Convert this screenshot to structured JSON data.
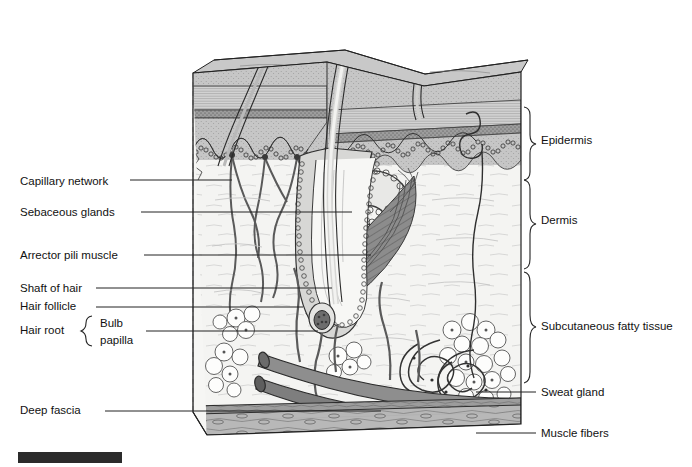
{
  "figure": {
    "title": "",
    "background_color": "#ffffff",
    "ink_color": "#111111"
  },
  "labels_left": [
    {
      "id": "capillary-network",
      "text": "Capillary network",
      "x": 20,
      "y": 185,
      "leader_y": 180,
      "leader_x_end": 232
    },
    {
      "id": "sebaceous-glands",
      "text": "Sebaceous glands",
      "x": 20,
      "y": 216,
      "leader_y": 212,
      "leader_x_end": 352
    },
    {
      "id": "arrector-pili",
      "text": "Arrector pili muscle",
      "x": 20,
      "y": 259,
      "leader_y": 255,
      "leader_x_end": 371
    },
    {
      "id": "shaft-of-hair",
      "text": "Shaft of hair",
      "x": 20,
      "y": 292,
      "leader_y": 288,
      "leader_x_end": 330
    },
    {
      "id": "hair-follicle",
      "text": "Hair follicle",
      "x": 20,
      "y": 310,
      "leader_y": 307,
      "leader_x_end": 303
    },
    {
      "id": "hair-root",
      "text": "Hair root",
      "x": 20,
      "y": 334,
      "leader_y": 0,
      "leader_x_end": 0
    },
    {
      "id": "deep-fascia",
      "text": "Deep fascia",
      "x": 20,
      "y": 414,
      "leader_y": 411,
      "leader_x_end": 381
    }
  ],
  "hair_root_group": {
    "bulb_text": "Bulb",
    "papilla_text": "papilla",
    "bulb_y": 327,
    "papilla_y": 344,
    "brace_x": 84,
    "leader_y": 331,
    "leader_x_start": 144,
    "leader_x_end": 318
  },
  "labels_right": [
    {
      "id": "epidermis",
      "text": "Epidermis",
      "x": 541,
      "y": 144,
      "brace_top": 107,
      "brace_bottom": 178,
      "brace_x": 528
    },
    {
      "id": "dermis",
      "text": "Dermis",
      "x": 541,
      "y": 224,
      "brace_top": 180,
      "brace_bottom": 269,
      "brace_x": 528
    },
    {
      "id": "subcutaneous-fatty-tissue",
      "text": "Subcutaneous fatty tissue",
      "x": 541,
      "y": 330,
      "brace_top": 272,
      "brace_bottom": 389,
      "brace_x": 528
    },
    {
      "id": "sweat-gland",
      "text": "Sweat gland",
      "x": 541,
      "y": 396,
      "leader_y": 392,
      "leader_x_start": 476,
      "leader_x_end": 536
    },
    {
      "id": "muscle-fibers",
      "text": "Muscle fibers",
      "x": 541,
      "y": 437,
      "leader_y": 433,
      "leader_x_start": 476,
      "leader_x_end": 536
    }
  ],
  "layers": {
    "stratum_corneum": {
      "name": "stratum corneum",
      "fill": "#cfcfcf"
    },
    "granular_band": {
      "name": "granular layer",
      "fill": "#8e8e8e"
    },
    "epidermis_body": {
      "name": "epidermis",
      "fill": "#c2c2c2"
    },
    "dermis": {
      "name": "dermis",
      "fill": "#f2f2f0"
    },
    "subcutaneous": {
      "name": "subcutaneous fat",
      "fill": "#fafaf8"
    },
    "deep_fascia": {
      "name": "deep fascia",
      "fill": "#9a9a9a"
    },
    "muscle": {
      "name": "muscle fibers",
      "fill": "#b5b5b5"
    },
    "top_surface": {
      "name": "skin surface",
      "fill": "#c8c8c8"
    }
  },
  "structures": [
    {
      "id": "hair-shaft-1",
      "name": "hair shaft"
    },
    {
      "id": "hair-shaft-2",
      "name": "hair shaft"
    },
    {
      "id": "hair-shaft-3",
      "name": "hair shaft"
    },
    {
      "id": "hair-follicle",
      "name": "hair follicle"
    },
    {
      "id": "hair-bulb",
      "name": "hair bulb and papilla"
    },
    {
      "id": "sebaceous-gland",
      "name": "sebaceous gland"
    },
    {
      "id": "arrector-muscle",
      "name": "arrector pili muscle"
    },
    {
      "id": "capillary-loops",
      "name": "capillary network"
    },
    {
      "id": "sweat-gland-coil",
      "name": "sweat gland"
    },
    {
      "id": "sweat-duct",
      "name": "sweat duct"
    },
    {
      "id": "fat-lobules",
      "name": "fat lobules"
    },
    {
      "id": "blood-vessels",
      "name": "blood vessels"
    }
  ],
  "page_artifact": {
    "id": "scan-bar",
    "x": 18,
    "y": 452,
    "width": 104,
    "height": 11,
    "color": "#2b2b2b"
  }
}
